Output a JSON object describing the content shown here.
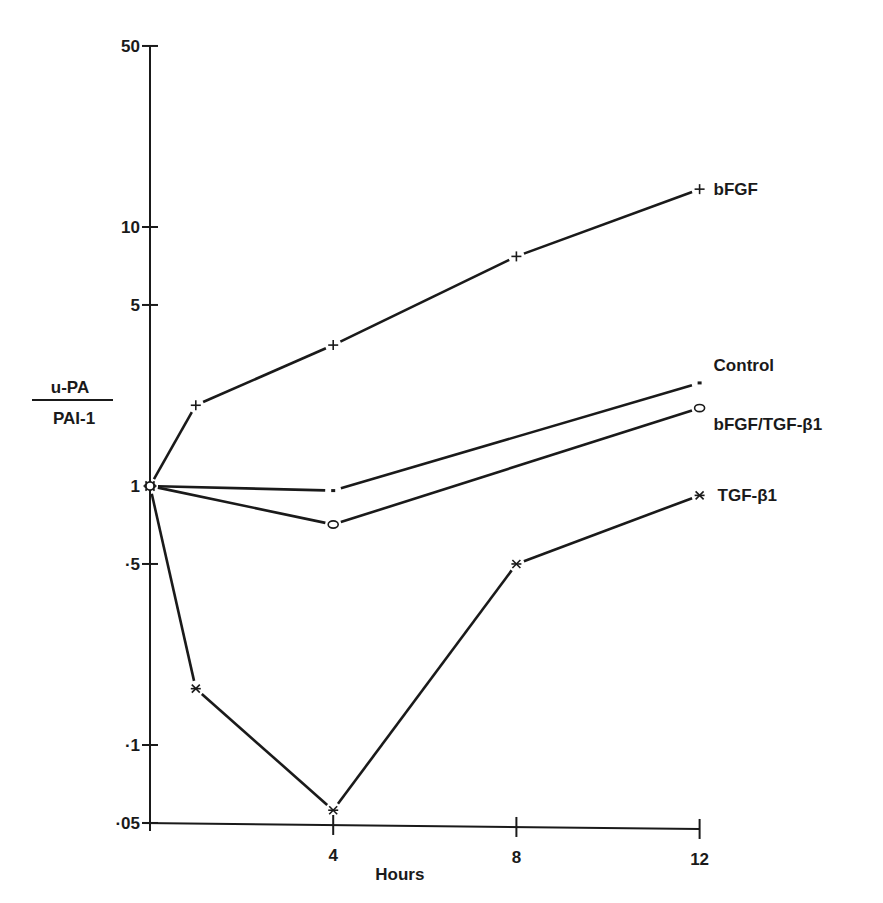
{
  "chart_data": {
    "type": "line",
    "title": "",
    "xlabel": "Hours",
    "ylabel": "u-PA / PAI-1",
    "ylabel_numerator": "u-PA",
    "ylabel_denominator": "PAI-1",
    "yscale": "log",
    "ylim": [
      0.05,
      50
    ],
    "xlim": [
      0,
      12
    ],
    "x_ticks": [
      4,
      8,
      12
    ],
    "x_tick_labels": [
      "4",
      "8",
      "12"
    ],
    "y_ticks": [
      0.05,
      0.1,
      0.5,
      1,
      5,
      10,
      50
    ],
    "y_tick_labels": [
      "·05",
      "·1",
      "·5",
      "1",
      "5",
      "10",
      "50"
    ],
    "grid": false,
    "legend_position": "inline-right",
    "x": [
      0,
      1,
      4,
      8,
      12
    ],
    "series": [
      {
        "name": "bFGF",
        "marker": "plus",
        "x": [
          0,
          1,
          4,
          8,
          12
        ],
        "values": [
          1.0,
          2.05,
          3.5,
          7.7,
          14.0
        ]
      },
      {
        "name": "Control",
        "marker": "dot",
        "x": [
          0,
          4,
          12
        ],
        "values": [
          1.0,
          0.96,
          2.5
        ]
      },
      {
        "name": "bFGF/TGF-β1",
        "marker": "diamond",
        "x": [
          0,
          4,
          12
        ],
        "values": [
          1.0,
          0.71,
          2.0
        ]
      },
      {
        "name": "TGF-β1",
        "marker": "asterisk",
        "x": [
          0,
          1,
          4,
          8,
          12
        ],
        "values": [
          1.0,
          0.165,
          0.056,
          0.5,
          0.92
        ]
      }
    ]
  }
}
